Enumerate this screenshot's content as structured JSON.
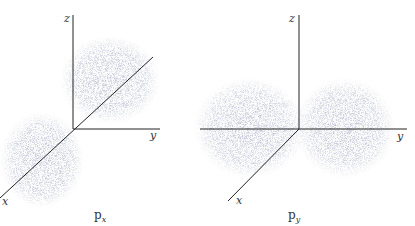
{
  "diagram": {
    "panels": [
      {
        "id": "px",
        "caption": "p",
        "caption_sub": "x",
        "axes": {
          "z": "z",
          "y": "y",
          "x": "x"
        },
        "lobes_along": "x"
      },
      {
        "id": "py",
        "caption": "p",
        "caption_sub": "y",
        "axes": {
          "z": "z",
          "y": "y",
          "x": "x"
        },
        "lobes_along": "y"
      }
    ],
    "colors": {
      "axis": "#222222",
      "dots": "#8a90a8",
      "text": "#333333"
    }
  }
}
